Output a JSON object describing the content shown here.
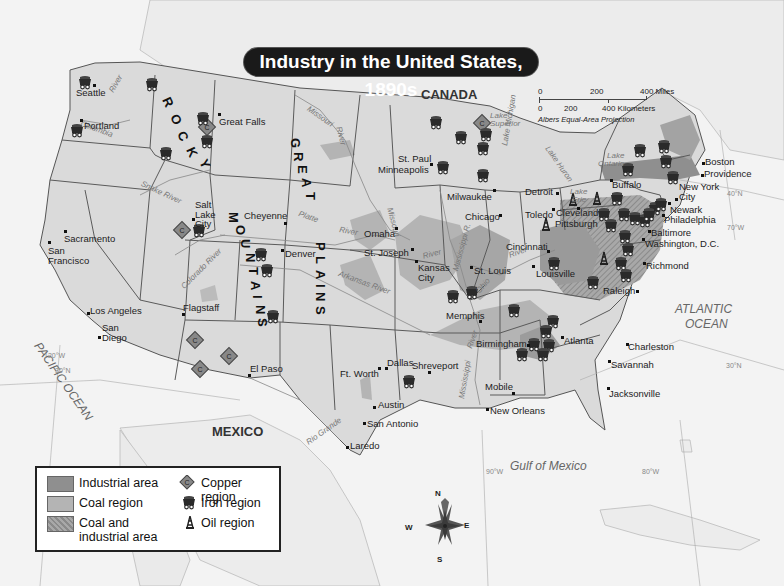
{
  "title": "Industry in the United States, 1890s",
  "scale": {
    "miles_ticks": [
      "0",
      "200",
      "400 Miles"
    ],
    "km_ticks": [
      "0",
      "200",
      "400 Kilometers"
    ],
    "projection": "Albers Equal-Area Projection"
  },
  "compass": {
    "n": "N",
    "s": "S",
    "e": "E",
    "w": "W"
  },
  "legend": {
    "items": [
      {
        "label": "Industrial area",
        "symbol": "swatch-dark",
        "color": "#8f8f8f"
      },
      {
        "label": "Coal region",
        "symbol": "swatch-medium",
        "color": "#b4b4b4"
      },
      {
        "label": "Coal and industrial area",
        "label_line1": "Coal and",
        "label_line2": "industrial area",
        "symbol": "swatch-hatched",
        "color": "#a2a2a2"
      },
      {
        "label": "Copper region",
        "symbol": "copper-diamond-icon"
      },
      {
        "label": "Iron region",
        "symbol": "mine-cart-icon"
      },
      {
        "label": "Oil region",
        "symbol": "oil-derrick-icon"
      }
    ]
  },
  "countries": {
    "canada": "CANADA",
    "mexico": "MEXICO"
  },
  "water_bodies": {
    "pacific": "PACIFIC OCEAN",
    "atlantic_1": "ATLANTIC",
    "atlantic_2": "OCEAN",
    "gulf": "Gulf of Mexico",
    "lake_superior_1": "Lake",
    "lake_superior_2": "Superior",
    "lake_michigan": "Lake Michigan",
    "lake_huron": "Lake Huron",
    "lake_erie_1": "Lake",
    "lake_erie_2": "Erie",
    "lake_ontario_1": "Lake",
    "lake_ontario_2": "Ontario"
  },
  "rivers": {
    "columbia": "Columbia",
    "columbia_river": "River",
    "snake": "Snake River",
    "missouri_north": "Missouri",
    "missouri_north_river": "River",
    "missouri_mid": "Missouri",
    "platte": "Platte",
    "platte_river": "River",
    "arkansas": "Arkansas River",
    "colorado": "Colorado River",
    "rio_grande": "Rio Grande",
    "mississippi_north": "Mississippi R.",
    "mississippi_south": "Mississippi",
    "mississippi_river": "River",
    "ohio": "Ohio",
    "ohio_river": "River",
    "kansas_river": "River"
  },
  "regions": {
    "rocky": [
      "R",
      "O",
      "C",
      "K",
      "Y"
    ],
    "mountains": [
      "M",
      "O",
      "U",
      "N",
      "T",
      "A",
      "I",
      "N",
      "S"
    ],
    "great": [
      "G",
      "R",
      "E",
      "A",
      "T"
    ],
    "plains": [
      "P",
      "L",
      "A",
      "I",
      "N",
      "S"
    ]
  },
  "gridlines": {
    "lat40": "40°N",
    "lat30_w": "30°N",
    "lat30_e": "30°N",
    "lon120": "120°W",
    "lon90": "90°W",
    "lon80": "80°W",
    "lon70": "70°W"
  },
  "cities": [
    {
      "name": "Seattle"
    },
    {
      "name": "Portland"
    },
    {
      "name": "Great Falls"
    },
    {
      "name": "Salt Lake City"
    },
    {
      "name": "Sacramento"
    },
    {
      "name": "San Francisco"
    },
    {
      "name": "Los Angeles"
    },
    {
      "name": "San Diego"
    },
    {
      "name": "Flagstaff"
    },
    {
      "name": "El Paso"
    },
    {
      "name": "Cheyenne"
    },
    {
      "name": "Denver"
    },
    {
      "name": "Omaha"
    },
    {
      "name": "St. Joseph"
    },
    {
      "name": "Kansas City"
    },
    {
      "name": "St. Paul"
    },
    {
      "name": "Minneapolis"
    },
    {
      "name": "Milwaukee"
    },
    {
      "name": "Chicago"
    },
    {
      "name": "St. Louis"
    },
    {
      "name": "Detroit"
    },
    {
      "name": "Toledo"
    },
    {
      "name": "Cleveland"
    },
    {
      "name": "Pittsburgh"
    },
    {
      "name": "Cincinnati"
    },
    {
      "name": "Louisville"
    },
    {
      "name": "Buffalo"
    },
    {
      "name": "Boston"
    },
    {
      "name": "Providence"
    },
    {
      "name": "New York City"
    },
    {
      "name": "Newark"
    },
    {
      "name": "Philadelphia"
    },
    {
      "name": "Baltimore"
    },
    {
      "name": "Washington, D.C."
    },
    {
      "name": "Richmond"
    },
    {
      "name": "Raleigh"
    },
    {
      "name": "Memphis"
    },
    {
      "name": "Birmingham"
    },
    {
      "name": "Atlanta"
    },
    {
      "name": "Charleston"
    },
    {
      "name": "Savannah"
    },
    {
      "name": "Jacksonville"
    },
    {
      "name": "Mobile"
    },
    {
      "name": "New Orleans"
    },
    {
      "name": "Shreveport"
    },
    {
      "name": "Dallas"
    },
    {
      "name": "Ft. Worth"
    },
    {
      "name": "Austin"
    },
    {
      "name": "San Antonio"
    },
    {
      "name": "Laredo"
    }
  ],
  "colors": {
    "ocean": "#f4f4f4",
    "land_us": "#dadada",
    "land_foreign": "#ececec",
    "industrial": "#8f8f8f",
    "coal": "#b4b4b4",
    "border": "#5a5a5a",
    "title_bg": "#1a1a1a"
  }
}
